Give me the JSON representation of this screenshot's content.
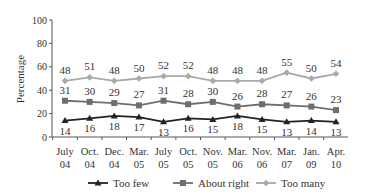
{
  "chart_data": {
    "type": "line",
    "title": "",
    "xlabel": "",
    "ylabel": "Percentage",
    "ylim": [
      0,
      100
    ],
    "yticks": [
      0,
      20,
      40,
      60,
      80,
      100
    ],
    "grid": false,
    "legend_position": "bottom",
    "categories": [
      [
        "July",
        "04"
      ],
      [
        "Oct.",
        "04"
      ],
      [
        "Dec.",
        "04"
      ],
      [
        "Mar.",
        "05"
      ],
      [
        "July",
        "05"
      ],
      [
        "Oct.",
        "05"
      ],
      [
        "Nov.",
        "05"
      ],
      [
        "Mar.",
        "06"
      ],
      [
        "Nov.",
        "06"
      ],
      [
        "Mar.",
        "07"
      ],
      [
        "Jan.",
        "09"
      ],
      [
        "Apr.",
        "10"
      ]
    ],
    "series": [
      {
        "name": "Too few",
        "marker": "triangle",
        "color": "#222222",
        "label_pos": "below",
        "values": [
          14,
          16,
          18,
          17,
          13,
          16,
          15,
          18,
          15,
          13,
          14,
          13
        ]
      },
      {
        "name": "About right",
        "marker": "square",
        "color": "#6e6e6e",
        "label_pos": "above",
        "values": [
          31,
          30,
          29,
          27,
          31,
          28,
          30,
          26,
          28,
          27,
          26,
          23
        ]
      },
      {
        "name": "Too many",
        "marker": "diamond",
        "color": "#a9a9a9",
        "label_pos": "above",
        "values": [
          48,
          51,
          48,
          50,
          52,
          52,
          48,
          48,
          48,
          55,
          50,
          54
        ]
      }
    ]
  }
}
